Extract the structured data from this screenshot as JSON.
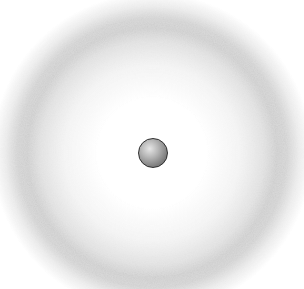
{
  "diagram": {
    "background_color": "#ffffff",
    "electron_cloud": {
      "shape": "ring",
      "center": [
        152,
        153
      ],
      "inner_radius": 55,
      "peak_radius": 125,
      "outer_radius": 160,
      "color": "#9a9a9a",
      "peak_opacity": 0.55
    },
    "nucleus": {
      "shape": "sphere",
      "center": [
        153,
        153
      ],
      "diameter": 30,
      "outline_color": "#2e2e2e",
      "fill_highlight": "#e6e6e6",
      "fill_shadow": "#5a5a5a"
    }
  }
}
